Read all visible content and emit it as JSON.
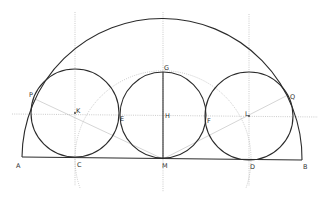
{
  "diagram": {
    "colors": {
      "solid": "#2b2b2b",
      "guide": "#a8a8a8",
      "ray": "#b8b8b8",
      "label": "#333333"
    },
    "points": {
      "A": {
        "label": "A",
        "x": 22,
        "y": 157
      },
      "B": {
        "label": "B",
        "x": 302,
        "y": 160
      },
      "C": {
        "label": "C",
        "x": 75,
        "y": 158
      },
      "D": {
        "label": "D",
        "x": 250,
        "y": 160
      },
      "M": {
        "label": "M",
        "x": 163,
        "y": 159
      },
      "G": {
        "label": "G",
        "x": 163,
        "y": 73
      },
      "H": {
        "label": "H",
        "x": 163,
        "y": 116
      },
      "K": {
        "label": "K",
        "x": 75,
        "y": 113
      },
      "L": {
        "label": "L",
        "x": 249,
        "y": 117
      },
      "E": {
        "label": "E",
        "x": 119,
        "y": 115
      },
      "F": {
        "label": "F",
        "x": 206,
        "y": 117
      },
      "P": {
        "label": "P",
        "x": 35,
        "y": 99
      },
      "Q": {
        "label": "Q",
        "x": 288,
        "y": 95
      }
    },
    "semicircle": {
      "cx": 163,
      "cy": 158,
      "r": 140
    },
    "circles": [
      {
        "name": "left-circle",
        "cx": 75,
        "cy": 113,
        "r": 44
      },
      {
        "name": "middle-circle",
        "cx": 163,
        "cy": 115,
        "r": 43
      },
      {
        "name": "right-circle",
        "cx": 249,
        "cy": 116,
        "r": 44
      }
    ],
    "guide_circle": {
      "cx": 163,
      "cy": 159,
      "r": 88
    }
  }
}
